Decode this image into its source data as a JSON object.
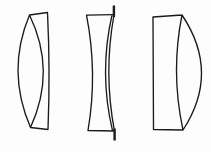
{
  "page": {
    "background_color": "#fdfdfd"
  },
  "diagram": {
    "kind": "lens-cross-sections",
    "stroke_color": "#1b1b1b",
    "lenses": [
      {
        "name": "biconvex-lens",
        "path": "M29.5,15 Q6,71 30.5,127.5 M29.5,15 Q56.6,71 30.5,127.5 M29.5,15 L47.5,12.5 M30.5,127.5 L48,129.5 M47.5,12.5 Q50.3,71 48,129.5"
      },
      {
        "name": "biconcave-lens",
        "path": "M86.5,15.2 L113.5,14.6 M88,130.5 L114,131 M86.5,15.2 Q97.8,73 88,130.5 M112,15 Q98.8,73 112.5,130.7 M113.8,16 Q103.6,73 114.3,130",
        "ticks": "M113.9,5.5 L113.9,17 M114.6,128.5 L114.6,140.5"
      },
      {
        "name": "plano-convex-lens",
        "path": "M153,17 L153.5,129.5 M153,17 L182,15 M153.5,129.5 L183,130 M182,15 Q220.5,72.5 183,130 M182,15 Q170.5,72.5 183,130"
      }
    ]
  }
}
